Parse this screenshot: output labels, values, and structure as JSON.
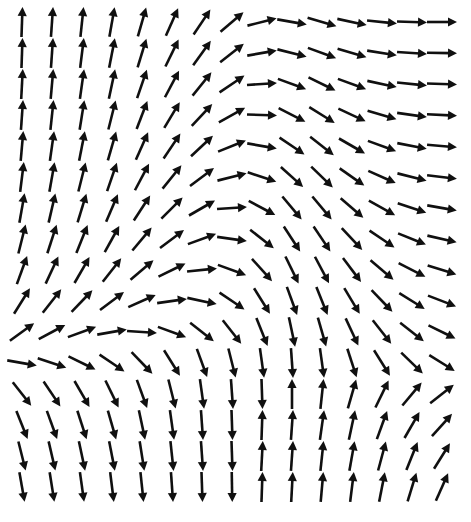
{
  "figure": {
    "title": "",
    "width": 471,
    "height": 522,
    "background_color": "#ffffff",
    "arrow_color": "#101010"
  },
  "chart_data": {
    "type": "scatter",
    "plot_kind": "quiver-vector-field",
    "title": "",
    "subtitle": "",
    "xlabel": "",
    "ylabel": "",
    "grid": false,
    "legend": null,
    "axes_visible": false,
    "tick_labels_x": [],
    "tick_labels_y": [],
    "xlim": [
      0,
      15
    ],
    "ylim": [
      0,
      16
    ],
    "grid_geometry": {
      "columns": 15,
      "rows": 16,
      "x_start_px": 22,
      "y_start_px": 22,
      "x_step_px": 30,
      "y_step_px": 31,
      "arrow_length_px": 30,
      "arrow_head_px": 9,
      "shaft_width_px": 2.6
    },
    "critical_points": [
      {
        "name": "saddle-right",
        "x_px": 441,
        "y_px": 240
      },
      {
        "name": "saddle-left",
        "x_px": 40,
        "y_px": 296
      }
    ],
    "arrow_angles_deg_rows": [
      [
        88,
        86,
        84,
        80,
        74,
        66,
        56,
        40,
        14,
        -10,
        -16,
        -12,
        -6,
        -2,
        0
      ],
      [
        88,
        86,
        83,
        79,
        73,
        64,
        54,
        38,
        10,
        -14,
        -20,
        -16,
        -9,
        -4,
        -1
      ],
      [
        87,
        85,
        82,
        78,
        71,
        62,
        51,
        34,
        4,
        -20,
        -26,
        -20,
        -12,
        -6,
        -2
      ],
      [
        86,
        84,
        81,
        76,
        69,
        59,
        47,
        29,
        -2,
        -27,
        -32,
        -25,
        -16,
        -8,
        -3
      ],
      [
        85,
        82,
        79,
        74,
        66,
        56,
        43,
        22,
        -10,
        -34,
        -38,
        -30,
        -20,
        -11,
        -5
      ],
      [
        83,
        80,
        76,
        71,
        62,
        51,
        37,
        14,
        -18,
        -42,
        -44,
        -35,
        -24,
        -14,
        -7
      ],
      [
        80,
        77,
        73,
        67,
        57,
        45,
        30,
        4,
        -28,
        -50,
        -50,
        -41,
        -29,
        -18,
        -10
      ],
      [
        76,
        72,
        68,
        61,
        50,
        37,
        20,
        -8,
        -38,
        -57,
        -56,
        -47,
        -34,
        -22,
        -13
      ],
      [
        70,
        65,
        60,
        52,
        40,
        26,
        6,
        -20,
        -48,
        -64,
        -62,
        -53,
        -40,
        -27,
        -17
      ],
      [
        58,
        52,
        46,
        37,
        24,
        8,
        -12,
        -34,
        -58,
        -70,
        -68,
        -59,
        -46,
        -32,
        -21
      ],
      [
        36,
        28,
        20,
        10,
        -4,
        -20,
        -38,
        -52,
        -68,
        -78,
        -74,
        -65,
        -52,
        -38,
        -26
      ],
      [
        -10,
        -18,
        -26,
        -34,
        -46,
        -58,
        -70,
        -76,
        -82,
        -86,
        -82,
        -72,
        -58,
        -44,
        -32
      ],
      [
        -52,
        -56,
        -60,
        -64,
        -70,
        -76,
        -82,
        -86,
        -88,
        90,
        84,
        74,
        64,
        50,
        38
      ],
      [
        -68,
        -70,
        -72,
        -74,
        -78,
        -82,
        -86,
        -88,
        88,
        86,
        82,
        78,
        70,
        60,
        48
      ],
      [
        -76,
        -77,
        -78,
        -79,
        -81,
        -84,
        -86,
        -88,
        87,
        86,
        84,
        80,
        75,
        68,
        58
      ],
      [
        -80,
        -81,
        -82,
        -83,
        -84,
        -86,
        -88,
        -89,
        88,
        87,
        85,
        83,
        79,
        73,
        66
      ]
    ]
  }
}
